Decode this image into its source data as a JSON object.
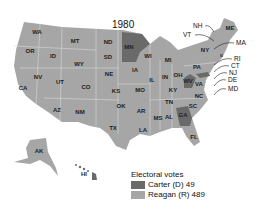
{
  "title": "1980",
  "colors": {
    "carter": "#6a6a6a",
    "reagan": "#a6a6a6",
    "border": "#d8d8d8"
  },
  "legend": {
    "heading": "Electoral votes",
    "items": [
      {
        "label": "Carter (D) 49",
        "party": "carter"
      },
      {
        "label": "Reagan (R) 489",
        "party": "reagan"
      }
    ]
  },
  "states": {
    "carter": [
      "MN",
      "WV",
      "GA",
      "HI",
      "MD",
      "RI"
    ],
    "reagan": [
      "WA",
      "OR",
      "CA",
      "ID",
      "NV",
      "MT",
      "WY",
      "UT",
      "AZ",
      "CO",
      "NM",
      "ND",
      "SD",
      "NE",
      "KS",
      "OK",
      "TX",
      "IA",
      "MO",
      "AR",
      "LA",
      "WI",
      "IL",
      "MI",
      "IN",
      "OH",
      "KY",
      "TN",
      "MS",
      "AL",
      "FL",
      "SC",
      "NC",
      "VA",
      "PA",
      "NY",
      "ME",
      "NH",
      "VT",
      "MA",
      "CT",
      "NJ",
      "DE",
      "AK"
    ]
  },
  "labels": [
    {
      "t": "WA",
      "x": 37,
      "y": 34
    },
    {
      "t": "OR",
      "x": 30,
      "y": 53
    },
    {
      "t": "CA",
      "x": 23,
      "y": 90
    },
    {
      "t": "ID",
      "x": 53,
      "y": 58
    },
    {
      "t": "NV",
      "x": 38,
      "y": 79
    },
    {
      "t": "MT",
      "x": 75,
      "y": 43
    },
    {
      "t": "WY",
      "x": 79,
      "y": 66
    },
    {
      "t": "UT",
      "x": 60,
      "y": 84
    },
    {
      "t": "CO",
      "x": 86,
      "y": 89
    },
    {
      "t": "AZ",
      "x": 57,
      "y": 112
    },
    {
      "t": "NM",
      "x": 80,
      "y": 114
    },
    {
      "t": "ND",
      "x": 108,
      "y": 44
    },
    {
      "t": "SD",
      "x": 108,
      "y": 59
    },
    {
      "t": "NE",
      "x": 109,
      "y": 76
    },
    {
      "t": "KS",
      "x": 116,
      "y": 93
    },
    {
      "t": "OK",
      "x": 121,
      "y": 108
    },
    {
      "t": "TX",
      "x": 113,
      "y": 130
    },
    {
      "t": "MN",
      "x": 129,
      "y": 49
    },
    {
      "t": "IA",
      "x": 135,
      "y": 72
    },
    {
      "t": "MO",
      "x": 140,
      "y": 92
    },
    {
      "t": "AR",
      "x": 141,
      "y": 113
    },
    {
      "t": "LA",
      "x": 143,
      "y": 132
    },
    {
      "t": "WI",
      "x": 148,
      "y": 58
    },
    {
      "t": "IL",
      "x": 152,
      "y": 82
    },
    {
      "t": "MI",
      "x": 168,
      "y": 62
    },
    {
      "t": "IN",
      "x": 165,
      "y": 79
    },
    {
      "t": "OH",
      "x": 178,
      "y": 77
    },
    {
      "t": "KY",
      "x": 173,
      "y": 92
    },
    {
      "t": "TN",
      "x": 169,
      "y": 104
    },
    {
      "t": "MS",
      "x": 158,
      "y": 120
    },
    {
      "t": "AL",
      "x": 169,
      "y": 119
    },
    {
      "t": "GA",
      "x": 183,
      "y": 117
    },
    {
      "t": "FL",
      "x": 194,
      "y": 139
    },
    {
      "t": "SC",
      "x": 193,
      "y": 108
    },
    {
      "t": "NC",
      "x": 199,
      "y": 98
    },
    {
      "t": "VA",
      "x": 199,
      "y": 86
    },
    {
      "t": "WV",
      "x": 188,
      "y": 83
    },
    {
      "t": "PA",
      "x": 197,
      "y": 69
    },
    {
      "t": "NY",
      "x": 205,
      "y": 52
    },
    {
      "t": "ME",
      "x": 230,
      "y": 30
    },
    {
      "t": "AK",
      "x": 39,
      "y": 153
    },
    {
      "t": "HI",
      "x": 84,
      "y": 176
    }
  ],
  "callouts": [
    {
      "t": "NH",
      "x": 193,
      "y": 28
    },
    {
      "t": "VT",
      "x": 183,
      "y": 37
    },
    {
      "t": "MA",
      "x": 236,
      "y": 45
    },
    {
      "t": "RI",
      "x": 234,
      "y": 61
    },
    {
      "t": "CT",
      "x": 231,
      "y": 68
    },
    {
      "t": "NJ",
      "x": 229,
      "y": 75
    },
    {
      "t": "DE",
      "x": 228,
      "y": 82
    },
    {
      "t": "MD",
      "x": 228,
      "y": 91
    }
  ]
}
